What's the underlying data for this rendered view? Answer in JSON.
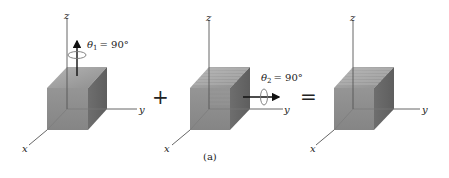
{
  "figure": {
    "caption": "(a)",
    "operators": {
      "plus": "+",
      "equals": "="
    },
    "colors": {
      "front_face": "#8c8c8c",
      "side_face": "#6b6b6b",
      "top_face": "#a8a8a8",
      "axis": "#555555",
      "stripe": "#bdbdbd"
    },
    "panels": [
      {
        "name": "rotation-1",
        "axes": {
          "x": "x",
          "y": "y",
          "z": "z"
        },
        "rotation": {
          "symbol": "θ",
          "subscript": "1",
          "equals": "= 90°",
          "about_axis": "z"
        }
      },
      {
        "name": "rotation-2",
        "axes": {
          "x": "x",
          "y": "y",
          "z": "z"
        },
        "rotation": {
          "symbol": "θ",
          "subscript": "2",
          "equals": "= 90°",
          "about_axis": "y"
        }
      },
      {
        "name": "result",
        "axes": {
          "x": "x",
          "y": "y",
          "z": "z"
        }
      }
    ]
  }
}
